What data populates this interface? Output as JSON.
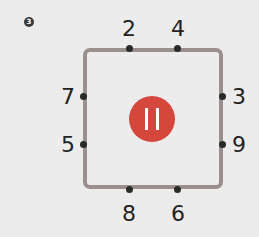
{
  "problem_number": "3",
  "center_label": "11",
  "center_icon": "pause-like-bars",
  "colors": {
    "center_circle": "#d4473d",
    "square_border": "#9a8f8c",
    "background": "#ececec"
  },
  "labels": {
    "top_left": "2",
    "top_right": "4",
    "left_upper": "7",
    "left_lower": "5",
    "right_upper": "3",
    "right_lower": "9",
    "bottom_left": "8",
    "bottom_right": "6"
  }
}
